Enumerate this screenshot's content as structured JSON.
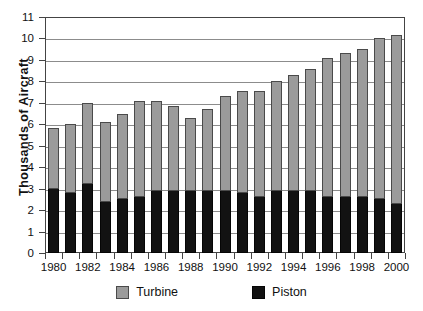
{
  "chart_data": {
    "type": "bar",
    "stacked": true,
    "title": "",
    "xlabel": "",
    "ylabel": "Thousands of Aircraft",
    "ylim": [
      0,
      11
    ],
    "ytick_labels": [
      "0",
      "1",
      "2",
      "3",
      "4",
      "5",
      "6",
      "7",
      "8",
      "9",
      "10",
      "11"
    ],
    "ytick_values": [
      0,
      1,
      2,
      3,
      4,
      5,
      6,
      7,
      8,
      9,
      10,
      11
    ],
    "grid": "horizontal",
    "legend_position": "bottom",
    "categories": [
      "1980",
      "1981",
      "1982",
      "1983",
      "1984",
      "1985",
      "1986",
      "1987",
      "1988",
      "1989",
      "1990",
      "1991",
      "1992",
      "1993",
      "1994",
      "1995",
      "1996",
      "1997",
      "1998",
      "1999",
      "2000"
    ],
    "xtick_labels_shown": [
      "1980",
      "1982",
      "1984",
      "1986",
      "1988",
      "1990",
      "1992",
      "1994",
      "1996",
      "1998",
      "2000"
    ],
    "series": [
      {
        "name": "Piston",
        "color": "#121212",
        "values": [
          3.0,
          2.8,
          3.2,
          2.4,
          2.5,
          2.6,
          2.9,
          2.9,
          2.9,
          2.9,
          2.9,
          2.8,
          2.6,
          2.9,
          2.9,
          2.9,
          2.6,
          2.6,
          2.6,
          2.5,
          2.3
        ]
      },
      {
        "name": "Turbine",
        "color": "#9b9b9b",
        "values": [
          2.85,
          3.2,
          3.8,
          3.7,
          4.0,
          4.5,
          4.2,
          3.95,
          3.4,
          3.8,
          4.4,
          4.75,
          4.95,
          5.1,
          5.4,
          5.7,
          6.5,
          6.7,
          6.9,
          7.5,
          7.85
        ]
      }
    ],
    "totals": [
      5.85,
      6.0,
      7.0,
      6.1,
      6.5,
      7.1,
      7.1,
      6.85,
      6.3,
      6.7,
      7.3,
      7.55,
      7.55,
      8.0,
      8.3,
      8.6,
      9.1,
      9.3,
      9.5,
      10.0,
      10.15
    ]
  },
  "axis": {
    "y_title": "Thousands of Aircraft"
  },
  "legend": {
    "items": [
      {
        "label": "Turbine",
        "color": "#9b9b9b"
      },
      {
        "label": "Piston",
        "color": "#121212"
      }
    ]
  }
}
